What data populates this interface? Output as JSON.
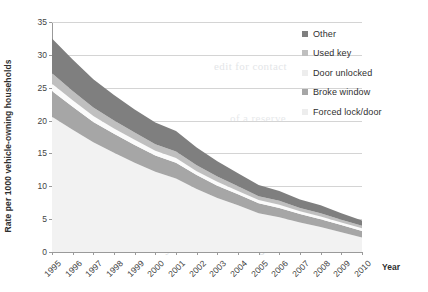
{
  "chart_data": {
    "type": "area",
    "stacked": true,
    "title": "",
    "xlabel": "Year",
    "ylabel": "Rate per 1000 vehicle-owning households",
    "x": [
      1995,
      1996,
      1997,
      1998,
      1999,
      2000,
      2001,
      2002,
      2003,
      2004,
      2005,
      2006,
      2007,
      2008,
      2009,
      2010
    ],
    "categories": [
      "1995",
      "1996",
      "1997",
      "1998",
      "1999",
      "2000",
      "2001",
      "2002",
      "2003",
      "2004",
      "2005",
      "2006",
      "2007",
      "2008",
      "2009",
      "2010"
    ],
    "xlim": [
      1995,
      2010
    ],
    "ylim": [
      0,
      35
    ],
    "yticks": [
      0,
      5,
      10,
      15,
      20,
      25,
      30,
      35
    ],
    "ytick_labels": [
      "0",
      "5",
      "10",
      "15",
      "20",
      "25",
      "30",
      "35"
    ],
    "grid": true,
    "legend_position": "top-right",
    "series": [
      {
        "name": "Forced lock/door",
        "color": "#f2f2f2",
        "values": [
          20.6,
          18.6,
          16.7,
          15.1,
          13.6,
          12.2,
          11.2,
          9.6,
          8.2,
          7.1,
          5.9,
          5.3,
          4.5,
          3.8,
          3.0,
          2.2
        ]
      },
      {
        "name": "Broke window",
        "color": "#a6a6a6",
        "values": [
          3.9,
          3.5,
          3.1,
          2.9,
          2.7,
          2.5,
          2.4,
          2.1,
          1.9,
          1.7,
          1.5,
          1.4,
          1.3,
          1.2,
          1.1,
          1.0
        ]
      },
      {
        "name": "Door unlocked",
        "color": "#fbfbfb",
        "values": [
          1.1,
          1.0,
          0.9,
          0.8,
          0.8,
          0.7,
          0.7,
          0.6,
          0.6,
          0.5,
          0.5,
          0.5,
          0.4,
          0.4,
          0.4,
          0.4
        ]
      },
      {
        "name": "Used key",
        "color": "#bfbfbf",
        "values": [
          1.6,
          1.4,
          1.3,
          1.2,
          1.1,
          1.0,
          1.0,
          0.9,
          0.8,
          0.7,
          0.6,
          0.6,
          0.5,
          0.5,
          0.4,
          0.4
        ]
      },
      {
        "name": "Other",
        "color": "#7f7f7f",
        "values": [
          5.3,
          4.8,
          4.3,
          3.9,
          3.5,
          3.3,
          3.1,
          2.7,
          2.3,
          2.0,
          1.7,
          1.5,
          1.3,
          1.2,
          1.0,
          0.8
        ]
      }
    ],
    "totals": [
      32.5,
      29.3,
      26.3,
      23.9,
      21.7,
      19.7,
      18.4,
      15.9,
      13.8,
      12.0,
      10.2,
      9.3,
      8.0,
      7.1,
      5.9,
      4.8
    ]
  },
  "legend": {
    "items": [
      {
        "label": "Other",
        "color": "#7f7f7f"
      },
      {
        "label": "Used key",
        "color": "#bfbfbf"
      },
      {
        "label": "Door unlocked",
        "color": "#fbfbfb"
      },
      {
        "label": "Broke window",
        "color": "#a6a6a6"
      },
      {
        "label": "Forced lock/door",
        "color": "#f2f2f2"
      }
    ]
  },
  "axes": {
    "y_title": "Rate per 1000 vehicle-owning households",
    "x_title": "Year"
  },
  "scan_bleed": {
    "lines": [
      "of a reserve",
      "edit for contact",
      "of ICO for another",
      "oveh out one Drafts and of",
      "lgi      th a  scas nally  an",
      "ncrimlnal Lnnucnng  oluueo  sie boarder  imits",
      "om 1992   need one away ano  dine  following  sectio"
    ]
  }
}
